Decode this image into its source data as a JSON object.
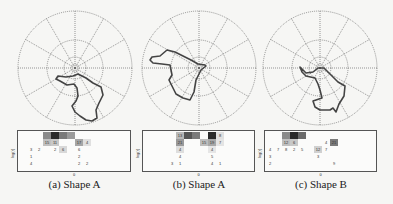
{
  "figure": {
    "panels": [
      {
        "caption": "(a) Shape A",
        "hist_ylabel": "log(r)",
        "hist_xlabel": "θ",
        "center": [
          75,
          68
        ],
        "shape_path": "M73,76 L78,74 L86,78 L93,83 L101,87 L103,95 L99,103 L96,110 L97,118 L92,121 L86,120 L80,116 L75,112 L72,106 L76,101 L78,96 L77,88 L74,84 L67,85 L60,81 L56,79 L58,76 L66,77 Z",
        "hist_left": 17,
        "hist_width": 114,
        "cells": [
          {
            "c": 3,
            "r": 0,
            "v": "",
            "shade": "#8a8a8a"
          },
          {
            "c": 4,
            "r": 0,
            "v": "",
            "shade": "#2a2a2a"
          },
          {
            "c": 5,
            "r": 0,
            "v": "",
            "shade": "#7a7a7a"
          },
          {
            "c": 6,
            "r": 0,
            "v": "",
            "shade": "#9a9a9a"
          },
          {
            "c": 3,
            "r": 1,
            "v": "15",
            "shade": "#c0c0c0"
          },
          {
            "c": 4,
            "r": 1,
            "v": "11",
            "shade": "#c8c8c8"
          },
          {
            "c": 7,
            "r": 1,
            "v": "17",
            "shade": "#a6a6a6"
          },
          {
            "c": 8,
            "r": 1,
            "v": "4",
            "shade": "#e0e0e0"
          },
          {
            "c": 1,
            "r": 2,
            "v": "3",
            "shade": ""
          },
          {
            "c": 2,
            "r": 2,
            "v": "2",
            "shade": ""
          },
          {
            "c": 4,
            "r": 2,
            "v": "2",
            "shade": ""
          },
          {
            "c": 5,
            "r": 2,
            "v": "6",
            "shade": "#d8d8d8"
          },
          {
            "c": 7,
            "r": 2,
            "v": "6",
            "shade": ""
          },
          {
            "c": 1,
            "r": 3,
            "v": "1",
            "shade": ""
          },
          {
            "c": 7,
            "r": 3,
            "v": "2",
            "shade": ""
          },
          {
            "c": 1,
            "r": 4,
            "v": "4",
            "shade": ""
          },
          {
            "c": 7,
            "r": 4,
            "v": "2",
            "shade": ""
          },
          {
            "c": 8,
            "r": 4,
            "v": "2",
            "shade": ""
          }
        ]
      },
      {
        "caption": "(b) Shape A",
        "hist_ylabel": "log(r)",
        "hist_xlabel": "θ",
        "center": [
          199,
          68
        ],
        "shape_path": "M206,66 L201,70 L196,80 L194,92 L190,100 L183,98 L176,94 L172,86 L169,80 L172,75 L170,65 L162,64 L153,63 L150,60 L152,57 L160,56 L167,50 L175,52 L183,56 L191,60 L198,64 L205,65 Z",
        "hist_left": 142,
        "hist_width": 113,
        "cells": [
          {
            "c": 4,
            "r": 0,
            "v": "13",
            "shade": "#b8b8b8"
          },
          {
            "c": 5,
            "r": 0,
            "v": "",
            "shade": "#555555"
          },
          {
            "c": 6,
            "r": 0,
            "v": "",
            "shade": "#7a7a7a"
          },
          {
            "c": 8,
            "r": 0,
            "v": "33",
            "shade": "#2a2a2a"
          },
          {
            "c": 9,
            "r": 0,
            "v": "8",
            "shade": "#e0e0e0"
          },
          {
            "c": 4,
            "r": 1,
            "v": "21",
            "shade": "#9a9a9a"
          },
          {
            "c": 7,
            "r": 1,
            "v": "15",
            "shade": "#bdbdbd"
          },
          {
            "c": 8,
            "r": 1,
            "v": "19",
            "shade": "#a8a8a8"
          },
          {
            "c": 9,
            "r": 1,
            "v": "7",
            "shade": "#e4e4e4"
          },
          {
            "c": 4,
            "r": 2,
            "v": "4",
            "shade": "#dedede"
          },
          {
            "c": 8,
            "r": 2,
            "v": "4",
            "shade": "#e6e6e6"
          },
          {
            "c": 4,
            "r": 3,
            "v": "4",
            "shade": ""
          },
          {
            "c": 8,
            "r": 3,
            "v": "5",
            "shade": ""
          },
          {
            "c": 3,
            "r": 4,
            "v": "3",
            "shade": ""
          },
          {
            "c": 4,
            "r": 4,
            "v": "1",
            "shade": ""
          },
          {
            "c": 8,
            "r": 4,
            "v": "4",
            "shade": ""
          },
          {
            "c": 9,
            "r": 4,
            "v": "1",
            "shade": ""
          }
        ]
      },
      {
        "caption": "(c) Shape B",
        "hist_ylabel": "log(r)",
        "hist_xlabel": "θ",
        "center": [
          320,
          68
        ],
        "shape_path": "M300,67 L306,73 L313,72 L318,68 L324,68 L330,74 L338,82 L345,86 L344,96 L339,104 L336,112 L333,108 L330,110 L320,110 L315,107 L313,101 L322,98 L320,90 L318,84 L315,78 L306,76 L302,72 Z",
        "hist_left": 264,
        "hist_width": 113,
        "cells": [
          {
            "c": 2,
            "r": 0,
            "v": "",
            "shade": "#8a8a8a"
          },
          {
            "c": 3,
            "r": 0,
            "v": "",
            "shade": "#2a2a2a"
          },
          {
            "c": 4,
            "r": 0,
            "v": "",
            "shade": "#6a6a6a"
          },
          {
            "c": 2,
            "r": 1,
            "v": "12",
            "shade": "#c0c0c0"
          },
          {
            "c": 3,
            "r": 1,
            "v": "6",
            "shade": "#c8c8c8"
          },
          {
            "c": 7,
            "r": 1,
            "v": "4",
            "shade": ""
          },
          {
            "c": 8,
            "r": 1,
            "v": "21",
            "shade": "#7a7a7a"
          },
          {
            "c": 0,
            "r": 2,
            "v": "4",
            "shade": ""
          },
          {
            "c": 1,
            "r": 2,
            "v": "7",
            "shade": ""
          },
          {
            "c": 2,
            "r": 2,
            "v": "8",
            "shade": ""
          },
          {
            "c": 3,
            "r": 2,
            "v": "2",
            "shade": ""
          },
          {
            "c": 4,
            "r": 2,
            "v": "5",
            "shade": ""
          },
          {
            "c": 6,
            "r": 2,
            "v": "12",
            "shade": "#d0d0d0"
          },
          {
            "c": 7,
            "r": 2,
            "v": "7",
            "shade": ""
          },
          {
            "c": 0,
            "r": 3,
            "v": "3",
            "shade": ""
          },
          {
            "c": 6,
            "r": 3,
            "v": "3",
            "shade": ""
          },
          {
            "c": 0,
            "r": 4,
            "v": "2",
            "shade": ""
          },
          {
            "c": 8,
            "r": 4,
            "v": "9",
            "shade": ""
          }
        ]
      }
    ]
  },
  "style": {
    "grid_color": "#555555",
    "shape_color": "#444444",
    "ring_radii": [
      4,
      11,
      28,
      57
    ],
    "spoke_count": 12
  }
}
